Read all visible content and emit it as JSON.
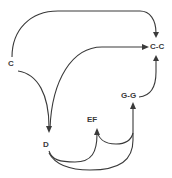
{
  "diagram": {
    "type": "directed-graph",
    "nodes": [
      {
        "id": "C",
        "label": "C"
      },
      {
        "id": "C-C",
        "label": "C-C"
      },
      {
        "id": "G-G",
        "label": "G-G"
      },
      {
        "id": "EF",
        "label": "EF"
      },
      {
        "id": "D",
        "label": "D"
      }
    ],
    "edges": [
      {
        "from": "C",
        "to": "C-C"
      },
      {
        "from": "C",
        "to": "D"
      },
      {
        "from": "D",
        "to": "C-C"
      },
      {
        "from": "G-G",
        "to": "C-C"
      },
      {
        "from": "D",
        "to": "EF"
      },
      {
        "from": "D",
        "to": "G-G"
      },
      {
        "from": "G-G",
        "to": "EF"
      }
    ],
    "colors": {
      "stroke": "#3a3a3a",
      "background": "#ffffff"
    }
  }
}
